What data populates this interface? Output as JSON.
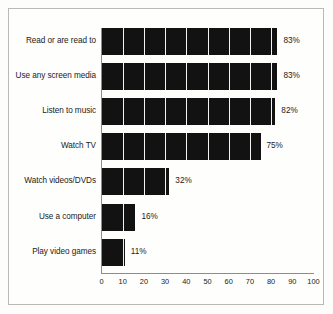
{
  "chart_data": {
    "type": "bar",
    "orientation": "horizontal",
    "title": "",
    "subtitle": "",
    "xlabel": "",
    "ylabel": "",
    "xlim": [
      0,
      100
    ],
    "xticks": [
      0,
      10,
      20,
      30,
      40,
      50,
      60,
      70,
      80,
      90,
      100
    ],
    "xtick_labels": [
      "0",
      "10",
      "20",
      "30",
      "40",
      "50",
      "60",
      "70",
      "80",
      "90",
      "100"
    ],
    "grid": "vertical-white-lines-every-10-units-inside-bars",
    "legend": "none",
    "bar_color": "#121212",
    "gridline_color": "#f2f2f0",
    "categories": [
      "Read or are read to",
      "Use any screen media",
      "Listen to music",
      "Watch TV",
      "Watch videos/DVDs",
      "Use a computer",
      "Play video games"
    ],
    "values": [
      83,
      83,
      82,
      75,
      32,
      16,
      11
    ],
    "value_labels": [
      "83%",
      "83%",
      "82%",
      "75%",
      "32%",
      "16%",
      "11%"
    ],
    "bars": [
      {
        "category": "Read or are read to",
        "value": 83,
        "label": "83%"
      },
      {
        "category": "Use any screen media",
        "value": 83,
        "label": "83%"
      },
      {
        "category": "Listen to music",
        "value": 82,
        "label": "82%"
      },
      {
        "category": "Watch TV",
        "value": 75,
        "label": "75%"
      },
      {
        "category": "Watch videos/DVDs",
        "value": 32,
        "label": "32%"
      },
      {
        "category": "Use a computer",
        "value": 16,
        "label": "16%"
      },
      {
        "category": "Play video games",
        "value": 11,
        "label": "11%"
      }
    ]
  }
}
